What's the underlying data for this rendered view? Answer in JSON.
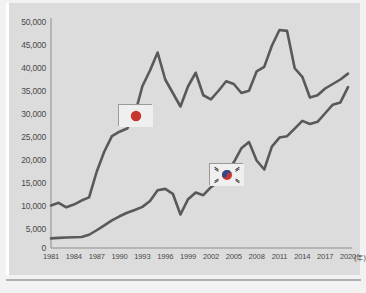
{
  "chart_data": {
    "type": "line",
    "title": "",
    "subtitle": "",
    "xlabel": "",
    "ylabel": "",
    "x_unit_label": "(年)",
    "xlim": [
      1981,
      2020
    ],
    "ylim": [
      0,
      50000
    ],
    "grid": false,
    "legend_position": "inline-flag-markers",
    "y_ticks": [
      "0",
      "5,000",
      "10,000",
      "15,000",
      "20,000",
      "25,000",
      "30,000",
      "35,000",
      "40,000",
      "45,000",
      "50,000"
    ],
    "y_tick_values": [
      0,
      5000,
      10000,
      15000,
      20000,
      25000,
      30000,
      35000,
      40000,
      45000,
      50000
    ],
    "x_ticks": [
      "1981",
      "1984",
      "1987",
      "1990",
      "1993",
      "1996",
      "1999",
      "2002",
      "2005",
      "2008",
      "2011",
      "2014",
      "2017",
      "2020"
    ],
    "x_tick_values": [
      1981,
      1984,
      1987,
      1990,
      1993,
      1996,
      1999,
      2002,
      2005,
      2008,
      2011,
      2014,
      2017,
      2020
    ],
    "x": [
      1981,
      1982,
      1983,
      1984,
      1985,
      1986,
      1987,
      1988,
      1989,
      1990,
      1991,
      1992,
      1993,
      1994,
      1995,
      1996,
      1997,
      1998,
      1999,
      2000,
      2001,
      2002,
      2003,
      2004,
      2005,
      2006,
      2007,
      2008,
      2009,
      2010,
      2011,
      2012,
      2013,
      2014,
      2015,
      2016,
      2017,
      2018,
      2019,
      2020
    ],
    "series": [
      {
        "name": "Japan",
        "marker_icon": "japan-flag-icon",
        "color": "#595959",
        "values": [
          9000,
          9600,
          8600,
          9200,
          10100,
          10800,
          16500,
          21000,
          24400,
          25400,
          26100,
          29200,
          35500,
          39000,
          43000,
          37000,
          34000,
          31000,
          35500,
          38500,
          33500,
          32600,
          34500,
          36600,
          36000,
          34000,
          34500,
          38800,
          39800,
          44500,
          48000,
          47800,
          39500,
          37600,
          33000,
          33500,
          35000,
          36000,
          37000,
          38300
        ]
      },
      {
        "name": "South Korea",
        "marker_icon": "south-korea-flag-icon",
        "color": "#595959",
        "values": [
          1700,
          1800,
          1900,
          1950,
          2000,
          2500,
          3500,
          4600,
          5700,
          6600,
          7400,
          8000,
          8700,
          10000,
          12400,
          12700,
          11600,
          7000,
          10400,
          11900,
          11300,
          13100,
          14200,
          15900,
          18600,
          21700,
          23100,
          19000,
          17000,
          22100,
          24100,
          24400,
          26100,
          27800,
          27100,
          27600,
          29500,
          31400,
          31900,
          35300
        ]
      }
    ],
    "annotations": [
      {
        "label": "japan-flag-marker",
        "at_year": 1992,
        "at_value": 29200
      },
      {
        "label": "south-korea-flag-marker",
        "at_year": 2004,
        "at_value": 15900
      }
    ]
  },
  "axis": {
    "y_ticks": [
      {
        "label": "50,000"
      },
      {
        "label": "45,000"
      },
      {
        "label": "40,000"
      },
      {
        "label": "35,000"
      },
      {
        "label": "30,000"
      },
      {
        "label": "25,000"
      },
      {
        "label": "20,000"
      },
      {
        "label": "15,000"
      },
      {
        "label": "10,000"
      },
      {
        "label": "5,000"
      },
      {
        "label": "0"
      }
    ],
    "x_ticks": [
      {
        "label": "1981"
      },
      {
        "label": "1984"
      },
      {
        "label": "1987"
      },
      {
        "label": "1990"
      },
      {
        "label": "1993"
      },
      {
        "label": "1996"
      },
      {
        "label": "1999"
      },
      {
        "label": "2002"
      },
      {
        "label": "2005"
      },
      {
        "label": "2008"
      },
      {
        "label": "2011"
      },
      {
        "label": "2014"
      },
      {
        "label": "2017"
      },
      {
        "label": "2020"
      }
    ],
    "x_unit": "(年)"
  },
  "colors": {
    "background": "#f2f2f2",
    "panel": "#dcdcdc",
    "line": "#595959",
    "axis": "#8d8d8d",
    "text": "#4a4a4a",
    "flag_red": "#c8352f",
    "flag_blue": "#2f4a8c",
    "flag_bg": "#efefef",
    "flag_border": "#9a9a9a"
  }
}
